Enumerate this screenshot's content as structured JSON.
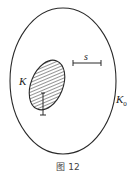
{
  "figure": {
    "caption": "图 12",
    "labels": {
      "inner_set": "K",
      "outer_set": "K",
      "outer_subscript": "0",
      "segment": "s"
    },
    "colors": {
      "stroke": "#2a2a2a",
      "hatch": "#3a3a3a",
      "background": "#ffffff"
    }
  }
}
